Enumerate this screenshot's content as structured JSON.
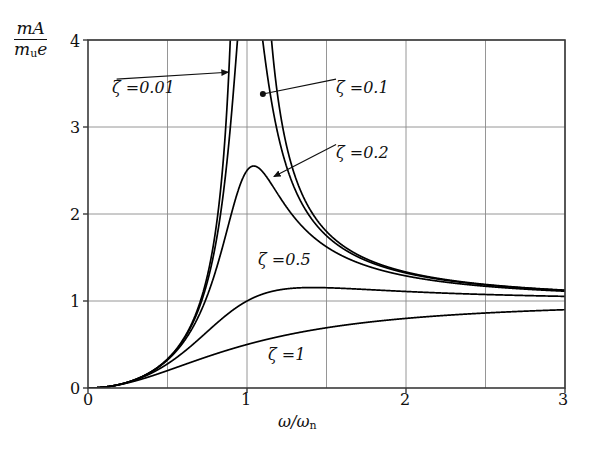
{
  "figure": {
    "title": "",
    "y_axis_label_numerator": "mA",
    "y_axis_label_denominator_m": "m",
    "y_axis_label_denominator_sub": "u",
    "y_axis_label_denominator_e": "e",
    "x_axis_label_omega": "ω/ω",
    "x_axis_label_sub": "n"
  },
  "axes": {
    "x_ticks": [
      "0",
      "1",
      "2",
      "3"
    ],
    "y_ticks": [
      "0",
      "1",
      "2",
      "3",
      "4"
    ]
  },
  "curve_labels": [
    {
      "name": "zeta-0-01",
      "zeta_symbol": "ζ",
      "equals": "=",
      "value": "0.01",
      "text": "ζ =0.01"
    },
    {
      "name": "zeta-0-1",
      "zeta_symbol": "ζ",
      "equals": "=",
      "value": "0.1",
      "text": "ζ =0.1"
    },
    {
      "name": "zeta-0-2",
      "zeta_symbol": "ζ",
      "equals": "=",
      "value": "0.2",
      "text": "ζ =0.2"
    },
    {
      "name": "zeta-0-5",
      "zeta_symbol": "ζ",
      "equals": "=",
      "value": "0.5",
      "text": "ζ =0.5"
    },
    {
      "name": "zeta-1",
      "zeta_symbol": "ζ",
      "equals": "=",
      "value": "1",
      "text": "ζ =1"
    }
  ],
  "colors": {
    "curve": "#000000",
    "frame": "#3a3a3a",
    "grid": "#8a8a8a",
    "text": "#101010",
    "background": "#ffffff"
  },
  "chart_data": {
    "type": "line",
    "title": "",
    "xlabel": "ω/ωn",
    "ylabel": "mA/(m_u e)",
    "xlim": [
      0,
      3
    ],
    "ylim": [
      0,
      4
    ],
    "xticks": [
      0,
      1,
      2,
      3
    ],
    "yticks": [
      0,
      1,
      2,
      3,
      4
    ],
    "grid": true,
    "grid_x": [
      0.5,
      1.0,
      1.5,
      2.0,
      2.5,
      3.0
    ],
    "grid_y": [
      1,
      2,
      3,
      4
    ],
    "legend": "inline-annotations",
    "formula": "r^2 / sqrt((1-r^2)^2 + (2*zeta*r)^2)",
    "series": [
      {
        "name": "ζ =0.01",
        "zeta": 0.01,
        "peak_x": 1.0,
        "peak_y": 50.0,
        "x": [
          0,
          0.1,
          0.2,
          0.3,
          0.4,
          0.5,
          0.6,
          0.7,
          0.8,
          0.9,
          0.95,
          1.0,
          1.05,
          1.1,
          1.2,
          1.3,
          1.5,
          1.75,
          2.0,
          2.25,
          2.5,
          2.75,
          3.0
        ],
        "values": [
          0,
          0.0101,
          0.0417,
          0.0989,
          0.1905,
          0.3333,
          0.5625,
          0.9607,
          1.7776,
          4.7277,
          9.7236,
          50.0,
          10.2619,
          5.2327,
          2.4572,
          1.7486,
          1.2987,
          1.1641,
          1.1027,
          1.0845,
          1.0698,
          1.0578,
          1.0536
        ],
        "style": "solid"
      },
      {
        "name": "ζ =0.1",
        "zeta": 0.1,
        "peak_x": 1.02,
        "peak_y": 5.03,
        "x": [
          0,
          0.1,
          0.2,
          0.3,
          0.4,
          0.5,
          0.6,
          0.7,
          0.8,
          0.9,
          0.95,
          1.0,
          1.05,
          1.1,
          1.2,
          1.3,
          1.5,
          1.75,
          2.0,
          2.25,
          2.5,
          2.75,
          3.0
        ],
        "values": [
          0,
          0.0101,
          0.0417,
          0.0988,
          0.1902,
          0.3326,
          0.5597,
          0.9489,
          1.7167,
          3.8298,
          4.848,
          5.0,
          4.201,
          3.1221,
          1.9964,
          1.5596,
          1.2649,
          1.1487,
          1.0939,
          1.0745,
          1.065,
          1.0555,
          1.0515
        ],
        "style": "solid"
      },
      {
        "name": "ζ =0.2",
        "zeta": 0.2,
        "peak_x": 1.09,
        "peak_y": 2.55,
        "x": [
          0,
          0.1,
          0.2,
          0.3,
          0.4,
          0.5,
          0.6,
          0.7,
          0.8,
          0.9,
          1.0,
          1.05,
          1.09,
          1.15,
          1.2,
          1.3,
          1.5,
          1.75,
          2.0,
          2.25,
          2.5,
          2.75,
          3.0
        ],
        "values": [
          0,
          0.0101,
          0.0417,
          0.0987,
          0.1894,
          0.3288,
          0.5435,
          0.8866,
          1.4737,
          2.2152,
          2.5,
          2.5498,
          2.5516,
          2.4258,
          2.2949,
          1.9884,
          1.5217,
          1.2836,
          1.1767,
          1.1267,
          1.0996,
          1.0816,
          1.0712
        ],
        "style": "solid"
      },
      {
        "name": "ζ =0.5",
        "zeta": 0.5,
        "peak_x": 1.41,
        "peak_y": 1.155,
        "x": [
          0,
          0.1,
          0.2,
          0.3,
          0.4,
          0.5,
          0.6,
          0.7,
          0.8,
          0.9,
          1.0,
          1.1,
          1.2,
          1.3,
          1.41,
          1.5,
          1.75,
          2.0,
          2.25,
          2.5,
          2.75,
          3.0
        ],
        "values": [
          0,
          0.01,
          0.0415,
          0.097,
          0.1819,
          0.2981,
          0.4412,
          0.5977,
          0.7482,
          0.8772,
          1.0,
          1.0693,
          1.1127,
          1.1395,
          1.1547,
          1.1507,
          1.1394,
          1.1094,
          1.0934,
          1.0816,
          1.0728,
          1.0661
        ],
        "style": "solid"
      },
      {
        "name": "ζ =1",
        "zeta": 1.0,
        "peak_x": 3.0,
        "peak_y": 0.9,
        "x": [
          0,
          0.1,
          0.2,
          0.3,
          0.4,
          0.5,
          0.6,
          0.7,
          0.8,
          0.9,
          1.0,
          1.1,
          1.2,
          1.3,
          1.5,
          1.75,
          2.0,
          2.25,
          2.5,
          2.75,
          3.0
        ],
        "values": [
          0,
          0.0098,
          0.0385,
          0.0826,
          0.1379,
          0.2,
          0.2647,
          0.3287,
          0.3902,
          0.4474,
          0.5,
          0.5474,
          0.5898,
          0.6274,
          0.6923,
          0.7552,
          0.8,
          0.8339,
          0.8621,
          0.8836,
          0.9
        ],
        "style": "solid"
      }
    ],
    "annotations": [
      {
        "label": "ζ =0.01",
        "x_text": 0.18,
        "y_text": 3.55,
        "arrow_to_x": 0.88,
        "arrow_to_y": 3.63,
        "marker": "arrow"
      },
      {
        "label": "ζ =0.1",
        "x_text": 1.56,
        "y_text": 3.55,
        "arrow_to_x": 1.1,
        "arrow_to_y": 3.38,
        "marker": "dot"
      },
      {
        "label": "ζ =0.2",
        "x_text": 1.56,
        "y_text": 2.8,
        "arrow_to_x": 1.17,
        "arrow_to_y": 2.43,
        "marker": "arrow"
      },
      {
        "label": "ζ =0.5",
        "x_text": 1.0,
        "y_text": 1.58,
        "marker": "none"
      },
      {
        "label": "ζ =1",
        "x_text": 1.08,
        "y_text": 0.48,
        "marker": "none"
      }
    ]
  }
}
